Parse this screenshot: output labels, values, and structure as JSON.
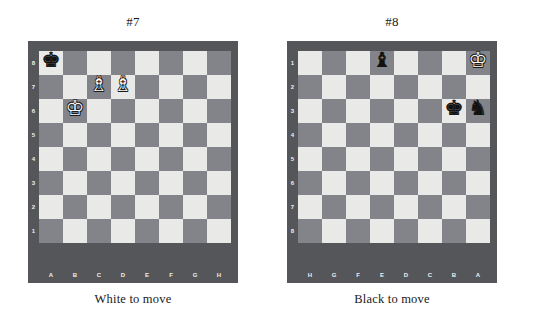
{
  "page": {
    "background_color": "#ffffff",
    "board_border_color": "#54565a",
    "light_square_color": "#e9e9e7",
    "dark_square_color": "#82848a",
    "label_color": "#f0f0f0"
  },
  "piece_glyphs": {
    "white_king": "♔",
    "white_queen": "♕",
    "white_rook": "♖",
    "white_bishop": "♗",
    "white_knight": "♘",
    "white_pawn": "♙",
    "black_king": "♚",
    "black_queen": "♛",
    "black_rook": "♜",
    "black_bishop": "♝",
    "black_knight": "♞",
    "black_pawn": "♟"
  },
  "puzzles": [
    {
      "title": "#7",
      "caption": "White to move",
      "orientation": "white",
      "file_labels": [
        "A",
        "B",
        "C",
        "D",
        "E",
        "F",
        "G",
        "H"
      ],
      "rank_labels": [
        "8",
        "7",
        "6",
        "5",
        "4",
        "3",
        "2",
        "1"
      ],
      "pieces": [
        {
          "square": "a8",
          "color": "black",
          "type": "king",
          "glyph": "♚",
          "row": 0,
          "col": 0
        },
        {
          "square": "c7",
          "color": "white",
          "type": "bishop",
          "glyph": "♗",
          "row": 1,
          "col": 2
        },
        {
          "square": "d7",
          "color": "white",
          "type": "bishop",
          "glyph": "♗",
          "row": 1,
          "col": 3
        },
        {
          "square": "b6",
          "color": "white",
          "type": "king",
          "glyph": "♔",
          "row": 2,
          "col": 1
        }
      ]
    },
    {
      "title": "#8",
      "caption": "Black to move",
      "orientation": "black",
      "file_labels": [
        "H",
        "G",
        "F",
        "E",
        "D",
        "C",
        "B",
        "A"
      ],
      "rank_labels": [
        "1",
        "2",
        "3",
        "4",
        "5",
        "6",
        "7",
        "8"
      ],
      "pieces": [
        {
          "square": "e1",
          "color": "black",
          "type": "bishop",
          "glyph": "♝",
          "row": 0,
          "col": 3
        },
        {
          "square": "a1",
          "color": "white",
          "type": "king",
          "glyph": "♔",
          "row": 0,
          "col": 7
        },
        {
          "square": "b3",
          "color": "black",
          "type": "king",
          "glyph": "♚",
          "row": 2,
          "col": 6
        },
        {
          "square": "a3",
          "color": "black",
          "type": "knight",
          "glyph": "♞",
          "row": 2,
          "col": 7
        }
      ]
    }
  ]
}
